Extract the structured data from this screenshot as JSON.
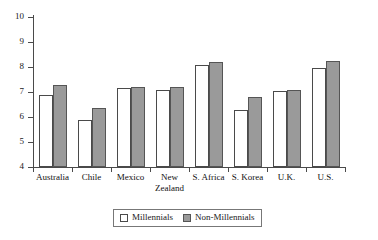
{
  "chart_data": {
    "type": "bar",
    "title": "",
    "xlabel": "",
    "ylabel": "",
    "ylim": [
      4,
      10
    ],
    "yticks": [
      4,
      5,
      6,
      7,
      8,
      9,
      10
    ],
    "grid": false,
    "legend_position": "bottom",
    "categories": [
      "Australia",
      "Chile",
      "Mexico",
      "New\nZealand",
      "S. Africa",
      "S. Korea",
      "U.K.",
      "U.S."
    ],
    "series": [
      {
        "name": "Millennials",
        "color": "#ffffff",
        "values": [
          6.9,
          5.9,
          7.15,
          7.1,
          8.1,
          6.3,
          7.05,
          7.95
        ]
      },
      {
        "name": "Non-Millennials",
        "color": "#9a9a9a",
        "values": [
          7.3,
          6.35,
          7.2,
          7.2,
          8.2,
          6.8,
          7.1,
          8.25
        ]
      }
    ]
  },
  "axis": {
    "y_tick_labels": [
      "10",
      "9",
      "8",
      "7",
      "6",
      "5",
      "4"
    ]
  },
  "categories_display": [
    {
      "line1": "Australia",
      "line2": ""
    },
    {
      "line1": "Chile",
      "line2": ""
    },
    {
      "line1": "Mexico",
      "line2": ""
    },
    {
      "line1": "New",
      "line2": "Zealand"
    },
    {
      "line1": "S. Africa",
      "line2": ""
    },
    {
      "line1": "S. Korea",
      "line2": ""
    },
    {
      "line1": "U.K.",
      "line2": ""
    },
    {
      "line1": "U.S.",
      "line2": ""
    }
  ],
  "legend": {
    "items": [
      {
        "label": "Millennials",
        "swatch": "white-square-swatch"
      },
      {
        "label": "Non-Millennials",
        "swatch": "gray-square-swatch"
      }
    ]
  }
}
